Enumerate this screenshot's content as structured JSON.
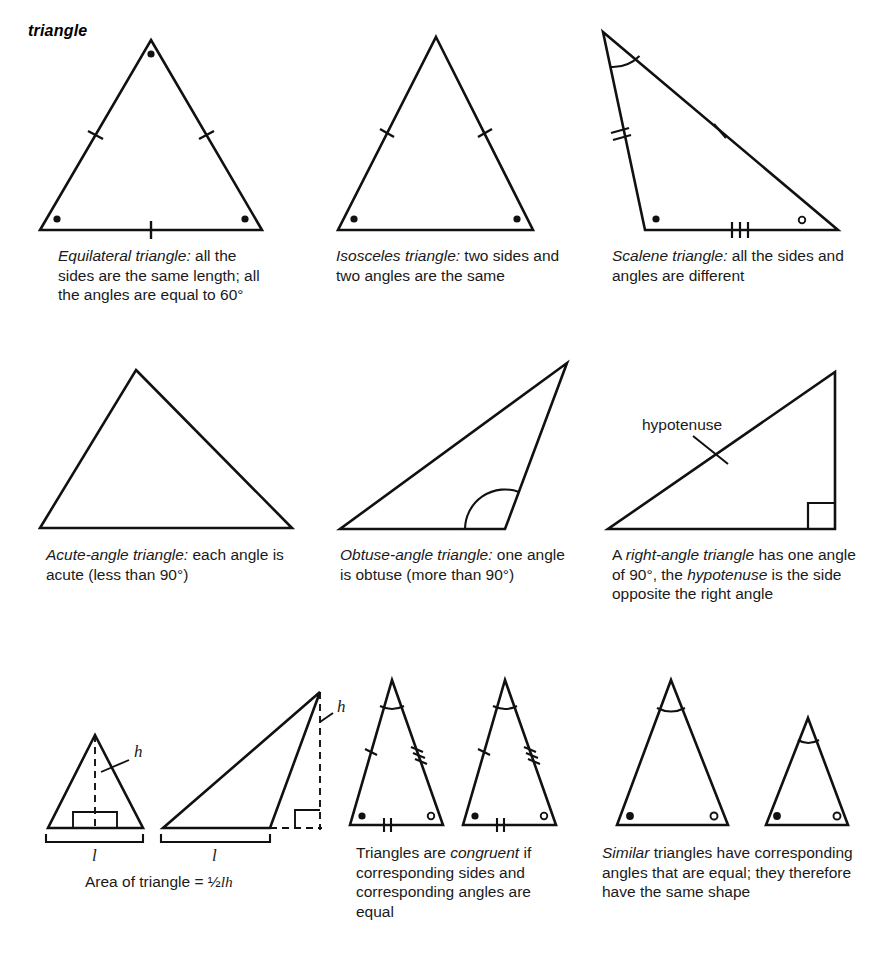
{
  "page": {
    "entry_title": "triangle",
    "width": 878,
    "height": 955,
    "background": "#ffffff",
    "ink_color": "#111111"
  },
  "figures": {
    "equilateral": {
      "name": "equilateral-triangle",
      "caption_plain": "Equilateral triangle: all the sides are the same length; all the angles are equal to 60°",
      "caption_italic_lead": "Equilateral triangle:",
      "caption_rest": " all the sides are the same length; all the angles are equal to 60°",
      "marks": {
        "side_ticks": {
          "left": 1,
          "right": 1,
          "base": 1
        },
        "angle_dots": {
          "apex": "filled",
          "base_left": "filled",
          "base_right": "filled"
        }
      }
    },
    "isosceles": {
      "name": "isosceles-triangle",
      "caption_italic_lead": "Isosceles triangle:",
      "caption_rest": " two sides and two angles are the same",
      "marks": {
        "side_ticks": {
          "left": 1,
          "right": 1,
          "base": 0
        },
        "angle_dots": {
          "base_left": "filled",
          "base_right": "filled"
        }
      }
    },
    "scalene": {
      "name": "scalene-triangle",
      "caption_italic_lead": "Scalene triangle:",
      "caption_rest": " all the sides and angles are different",
      "marks": {
        "side_ticks": {
          "left": 2,
          "hypotenuse": 1,
          "base": 3
        },
        "angle_marks": {
          "apex": "arc",
          "base_left": "filled-dot",
          "base_right": "hollow-dot"
        }
      }
    },
    "acute": {
      "name": "acute-angle-triangle",
      "caption_italic_lead": "Acute-angle triangle:",
      "caption_rest": " each angle is acute (less than 90°)",
      "marks": {
        "side_ticks": {},
        "angle_marks": {}
      }
    },
    "obtuse": {
      "name": "obtuse-angle-triangle",
      "caption_italic_lead": "Obtuse-angle triangle:",
      "caption_rest": " one angle is obtuse (more than 90°)",
      "marks": {
        "angle_marks": {
          "base_right": "arc"
        }
      }
    },
    "right": {
      "name": "right-angle-triangle",
      "caption_pre": "A ",
      "caption_italic_1": "right-angle triangle",
      "caption_mid": " has one angle of 90°, the ",
      "caption_italic_2": "hypotenuse",
      "caption_post": " is the side opposite the right angle",
      "label_hypotenuse": "hypotenuse",
      "marks": {
        "angle_marks": {
          "bottom_right": "right-angle-square"
        }
      }
    },
    "area_acute": {
      "name": "area-triangle-acute",
      "label_height": "h",
      "label_base": "l",
      "marks": {
        "height_line": "dashed-internal",
        "right_angle": "square-at-foot",
        "base_bracket": true
      }
    },
    "area_obtuse": {
      "name": "area-triangle-obtuse",
      "label_height": "h",
      "label_base": "l",
      "marks": {
        "height_line": "dashed-external",
        "right_angle": "square-at-foot",
        "base_bracket": true
      }
    },
    "area_formula": {
      "name": "area-of-triangle-formula",
      "text_pre": "Area of triangle = ½",
      "var_l": "l",
      "var_h": "h",
      "full_text": "Area of triangle = ½ l h"
    },
    "congruent": {
      "name": "congruent-triangles",
      "caption_pre": "Triangles are ",
      "caption_italic": "congruent",
      "caption_post": " if corresponding sides and corresponding angles are equal",
      "marks": {
        "apex": "arc",
        "side_ticks": {
          "left": 1,
          "right": 3,
          "base": 2
        },
        "angle_dots": {
          "base_left": "filled",
          "base_right": "hollow"
        }
      },
      "count": 2
    },
    "similar": {
      "name": "similar-triangles",
      "caption_italic": "Similar",
      "caption_post": " triangles have corresponding angles that are equal; they therefore have the same shape",
      "marks": {
        "apex": "arc",
        "side_ticks": {},
        "angle_dots": {
          "base_left": "filled",
          "base_right": "hollow"
        }
      },
      "count": 2,
      "sizes": [
        "large",
        "small"
      ]
    }
  }
}
